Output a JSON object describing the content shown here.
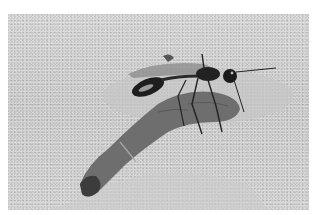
{
  "caption": {
    "text": ""
  },
  "photo": {
    "subject": "wasp dragging caterpillar over sand",
    "colors": {
      "sand": "#d4d4d4",
      "sand_shadow": "#b8b8b8",
      "caterpillar": "#6e6e6e",
      "caterpillar_dark": "#3c3c3c",
      "wasp": "#1e1e1e",
      "wasp_highlight": "#9a9a9a"
    }
  }
}
